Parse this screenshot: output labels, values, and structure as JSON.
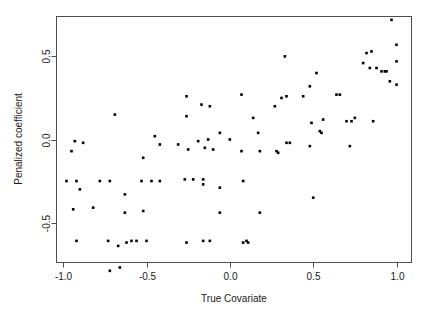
{
  "chart_data": {
    "type": "scatter",
    "title": "",
    "xlabel": "True Covariate",
    "ylabel": "Penalized coefficient",
    "xlim": [
      -1.04,
      1.09
    ],
    "ylim": [
      -0.74,
      0.74
    ],
    "xticks": [
      -1.0,
      -0.5,
      0.0,
      0.5,
      1.0
    ],
    "xticklabels": [
      "-1.0",
      "-0.5",
      "0.0",
      "0.5",
      "1.0"
    ],
    "yticks": [
      -0.5,
      0.0,
      0.5
    ],
    "yticklabels": [
      "-0.5",
      "0.0",
      "0.5"
    ],
    "grid": false,
    "legend": null,
    "marker": "filled-square",
    "marker_color": "#000000",
    "marker_size": 2.6,
    "n_points": 118,
    "points": [
      [
        -0.69,
        0.15
      ],
      [
        -0.45,
        0.02
      ],
      [
        -0.93,
        -0.01
      ],
      [
        -0.88,
        -0.02
      ],
      [
        -0.95,
        -0.07
      ],
      [
        -0.52,
        -0.11
      ],
      [
        -0.42,
        -0.03
      ],
      [
        -0.98,
        -0.25
      ],
      [
        -0.92,
        -0.25
      ],
      [
        -0.9,
        -0.3
      ],
      [
        -0.78,
        -0.25
      ],
      [
        -0.72,
        -0.25
      ],
      [
        -0.63,
        -0.33
      ],
      [
        -0.53,
        -0.25
      ],
      [
        -0.47,
        -0.25
      ],
      [
        -0.42,
        -0.25
      ],
      [
        -0.94,
        -0.42
      ],
      [
        -0.82,
        -0.41
      ],
      [
        -0.63,
        -0.44
      ],
      [
        -0.52,
        -0.43
      ],
      [
        -0.92,
        -0.61
      ],
      [
        -0.73,
        -0.61
      ],
      [
        -0.67,
        -0.64
      ],
      [
        -0.62,
        -0.62
      ],
      [
        -0.59,
        -0.61
      ],
      [
        -0.56,
        -0.61
      ],
      [
        -0.5,
        -0.61
      ],
      [
        -0.72,
        -0.79
      ],
      [
        -0.66,
        -0.77
      ],
      [
        -0.26,
        0.26
      ],
      [
        -0.17,
        0.21
      ],
      [
        -0.12,
        0.2
      ],
      [
        -0.26,
        0.14
      ],
      [
        -0.19,
        -0.01
      ],
      [
        -0.13,
        0.0
      ],
      [
        -0.06,
        0.04
      ],
      [
        -0.31,
        -0.03
      ],
      [
        -0.25,
        -0.06
      ],
      [
        -0.15,
        -0.05
      ],
      [
        -0.1,
        -0.06
      ],
      [
        -0.27,
        -0.24
      ],
      [
        -0.22,
        -0.24
      ],
      [
        -0.16,
        -0.24
      ],
      [
        -0.16,
        -0.27
      ],
      [
        -0.06,
        -0.29
      ],
      [
        -0.26,
        -0.62
      ],
      [
        -0.16,
        -0.61
      ],
      [
        -0.12,
        -0.61
      ],
      [
        -0.06,
        -0.44
      ],
      [
        0.07,
        0.27
      ],
      [
        0.14,
        0.13
      ],
      [
        0.0,
        0.0
      ],
      [
        0.17,
        0.04
      ],
      [
        0.33,
        0.5
      ],
      [
        0.34,
        -0.02
      ],
      [
        0.36,
        -0.02
      ],
      [
        0.07,
        -0.07
      ],
      [
        0.18,
        -0.07
      ],
      [
        0.28,
        -0.07
      ],
      [
        0.29,
        -0.08
      ],
      [
        0.08,
        -0.25
      ],
      [
        0.18,
        -0.44
      ],
      [
        0.08,
        -0.62
      ],
      [
        0.1,
        -0.61
      ],
      [
        0.11,
        -0.62
      ],
      [
        0.31,
        0.25
      ],
      [
        0.27,
        0.2
      ],
      [
        0.34,
        0.26
      ],
      [
        0.44,
        0.26
      ],
      [
        0.52,
        0.4
      ],
      [
        0.48,
        0.32
      ],
      [
        0.64,
        0.27
      ],
      [
        0.66,
        0.27
      ],
      [
        0.49,
        0.1
      ],
      [
        0.56,
        0.12
      ],
      [
        0.54,
        0.05
      ],
      [
        0.55,
        0.04
      ],
      [
        0.48,
        -0.04
      ],
      [
        0.7,
        0.11
      ],
      [
        0.73,
        0.11
      ],
      [
        0.75,
        0.13
      ],
      [
        0.86,
        0.11
      ],
      [
        0.72,
        -0.04
      ],
      [
        0.5,
        -0.35
      ],
      [
        0.97,
        0.72
      ],
      [
        0.85,
        0.53
      ],
      [
        0.82,
        0.52
      ],
      [
        1.0,
        0.57
      ],
      [
        0.8,
        0.46
      ],
      [
        0.84,
        0.43
      ],
      [
        1.0,
        0.47
      ],
      [
        0.93,
        0.41
      ],
      [
        0.91,
        0.41
      ],
      [
        0.94,
        0.41
      ],
      [
        0.96,
        0.35
      ],
      [
        1.0,
        0.33
      ],
      [
        0.88,
        0.43
      ]
    ]
  },
  "axis": {
    "xlabel": "True Covariate",
    "ylabel": "Penalized coefficient",
    "xticklabels": [
      "-1.0",
      "-0.5",
      "0.0",
      "0.5",
      "1.0"
    ],
    "yticklabels": [
      "0.5",
      "0.0",
      "-0.5"
    ]
  },
  "style": {
    "axis_color": "#4d4d4d",
    "text_color": "#1a1a1a",
    "point_color": "#000000",
    "background": "#ffffff"
  }
}
